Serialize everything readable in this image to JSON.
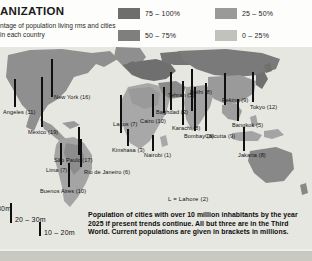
{
  "header": {
    "title": "ANIZATION",
    "subtitle": "ntage of population living\nrms and cities in each country",
    "legend": [
      {
        "label": "75 – 100%",
        "color": "#6e6e6e"
      },
      {
        "label": "50 – 75%",
        "color": "#7f7f7f"
      },
      {
        "label": "25 – 50%",
        "color": "#9a9a9a"
      },
      {
        "label": "0 – 25%",
        "color": "#c2c2bd"
      }
    ]
  },
  "map": {
    "ocean_color": "#e7e7e2",
    "bar_color": "#101010",
    "cities": [
      {
        "name": "Angeles (11)",
        "x": 15,
        "y": 62,
        "bar_x": 14,
        "bar_top": 32,
        "bar_h": 28
      },
      {
        "name": "New York (16)",
        "x": 70,
        "y": 47,
        "bar_x": 51,
        "bar_top": 12,
        "bar_h": 38
      },
      {
        "name": "Mexico (19)",
        "x": 35,
        "y": 82,
        "bar_x": 41,
        "bar_top": 30,
        "bar_h": 50
      },
      {
        "name": "Lima (7)",
        "x": 54,
        "y": 120,
        "bar_x": 60,
        "bar_top": 96,
        "bar_h": 22
      },
      {
        "name": "São Paulo (17)",
        "x": 70,
        "y": 110,
        "bar_x": 78,
        "bar_top": 80,
        "bar_h": 28
      },
      {
        "name": "Rio de Janeiro (6)",
        "x": 95,
        "y": 122,
        "bar_x": 80,
        "bar_top": 92,
        "bar_h": 28
      },
      {
        "name": "Buenos Aires (10)",
        "x": 62,
        "y": 141,
        "bar_x": 68,
        "bar_top": 116,
        "bar_h": 24
      },
      {
        "name": "Lagos (7)",
        "x": 119,
        "y": 74,
        "bar_x": 120,
        "bar_top": 48,
        "bar_h": 38
      },
      {
        "name": "Kinshasa (3)",
        "x": 120,
        "y": 100,
        "bar_x": 127,
        "bar_top": 82,
        "bar_h": 17
      },
      {
        "name": "Nairobi (1)",
        "x": 154,
        "y": 105,
        "bar_x": 152,
        "bar_top": 88,
        "bar_h": 16
      },
      {
        "name": "Cairo (10)",
        "x": 146,
        "y": 71,
        "bar_x": 152,
        "bar_top": 47,
        "bar_h": 23
      },
      {
        "name": "Tehran (5)",
        "x": 176,
        "y": 45,
        "bar_x": 170,
        "bar_top": 25,
        "bar_h": 38
      },
      {
        "name": "Baghdad (3)",
        "x": 167,
        "y": 62,
        "bar_x": 163,
        "bar_top": 40,
        "bar_h": 26
      },
      {
        "name": "Karachi (8)",
        "x": 177,
        "y": 78,
        "bar_x": 182,
        "bar_top": 34,
        "bar_h": 44
      },
      {
        "name": "Delhi (8)",
        "x": 196,
        "y": 42,
        "bar_x": 191,
        "bar_top": 22,
        "bar_h": 42
      },
      {
        "name": "Bombay (8)",
        "x": 190,
        "y": 86,
        "bar_x": 194,
        "bar_top": 40,
        "bar_h": 44
      },
      {
        "name": "Calcutta (9)",
        "x": 211,
        "y": 86,
        "bar_x": 205,
        "bar_top": 36,
        "bar_h": 48
      },
      {
        "name": "Peking (9)",
        "x": 227,
        "y": 50,
        "bar_x": 224,
        "bar_top": 26,
        "bar_h": 32
      },
      {
        "name": "Tokyo (12)",
        "x": 255,
        "y": 57,
        "bar_x": 252,
        "bar_top": 25,
        "bar_h": 30
      },
      {
        "name": "Bangkok (5)",
        "x": 238,
        "y": 75,
        "bar_x": 237,
        "bar_top": 52,
        "bar_h": 22
      },
      {
        "name": "Jakarta (8)",
        "x": 243,
        "y": 105,
        "bar_x": 243,
        "bar_top": 80,
        "bar_h": 24
      }
    ]
  },
  "scale_legend": {
    "items": [
      {
        "label": "30m",
        "height": 26
      },
      {
        "label": "20 – 30m",
        "height": 20
      },
      {
        "label": "10 – 20m",
        "height": 14
      }
    ]
  },
  "note": "L = Lahore (2)",
  "caption": "Population of cities with over 10 million inhabitants by the year 2025 if present trends continue. All but three are in the Third World. Current populations are given in brackets in millions."
}
